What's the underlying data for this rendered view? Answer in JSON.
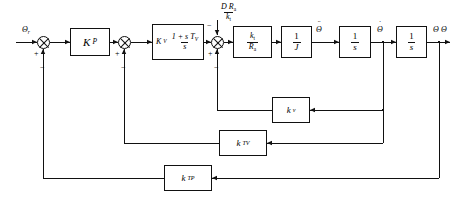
{
  "diagram": {
    "type": "control-block-diagram",
    "line_color": "#111111",
    "background": "#ffffff",
    "inputs": [
      {
        "id": "reference",
        "label_base": "Θ",
        "label_sub": "r",
        "description": "reference position input"
      },
      {
        "id": "disturbance",
        "num_main": "D R",
        "num_sub": "a",
        "den_main": "k",
        "den_sub": "t",
        "description": "load disturbance input"
      }
    ],
    "outputs": [
      {
        "id": "theta-out",
        "label_base": "Θ",
        "description": "output position"
      }
    ],
    "blocks": [
      {
        "id": "kp",
        "kind": "gain",
        "main": "K",
        "sub": "P",
        "description": "position controller proportional gain"
      },
      {
        "id": "kv-tf",
        "kind": "transfer",
        "main": "K",
        "sub": "V",
        "num": "1 + s T",
        "num_sub": "V",
        "den": "s",
        "description": "velocity PI controller"
      },
      {
        "id": "kt-ra",
        "kind": "fraction",
        "num": "k",
        "num_sub": "t",
        "den": "R",
        "den_sub": "a",
        "description": "motor torque constant over armature resistance"
      },
      {
        "id": "inv-j",
        "kind": "fraction",
        "num": "1",
        "den": "J",
        "description": "inverse inertia"
      },
      {
        "id": "int-1",
        "kind": "fraction",
        "num": "1",
        "den": "s",
        "description": "first integrator"
      },
      {
        "id": "int-2",
        "kind": "fraction",
        "num": "1",
        "den": "s",
        "description": "second integrator"
      },
      {
        "id": "kv-fb",
        "kind": "gain",
        "main": "k",
        "sub": "v",
        "description": "back-EMF feedback gain"
      },
      {
        "id": "ktv-fb",
        "kind": "gain",
        "main": "k",
        "sub": "TV",
        "description": "velocity tachometer feedback gain"
      },
      {
        "id": "ktp-fb",
        "kind": "gain",
        "main": "k",
        "sub": "TP",
        "description": "position transducer feedback gain"
      }
    ],
    "signals": [
      {
        "id": "theta-ddot",
        "base": "Θ",
        "dots": "¨",
        "description": "angular acceleration"
      },
      {
        "id": "theta-dot",
        "base": "Θ",
        "dots": "˙",
        "description": "angular velocity"
      },
      {
        "id": "theta",
        "base": "Θ",
        "dots": "",
        "description": "angular position"
      }
    ],
    "summing_junctions": [
      {
        "id": "sum-1",
        "signs": {
          "in_left": "+",
          "in_bottom": "−"
        },
        "description": "position error junction"
      },
      {
        "id": "sum-2",
        "signs": {
          "in_left": "+",
          "in_bottom": "−"
        },
        "description": "velocity error junction"
      },
      {
        "id": "sum-3",
        "signs": {
          "in_left": "+",
          "in_top": "−",
          "in_bottom": "−"
        },
        "description": "torque summation junction"
      }
    ]
  }
}
